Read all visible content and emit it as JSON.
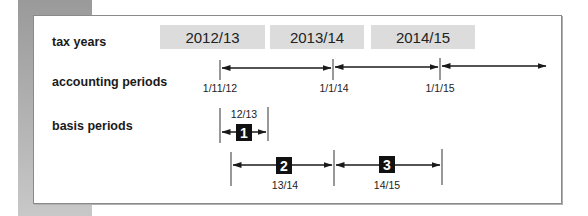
{
  "labels": {
    "tax_years": "tax years",
    "accounting_periods": "accounting periods",
    "basis_periods": "basis periods"
  },
  "tax_years": [
    {
      "label": "2012/13"
    },
    {
      "label": "2013/14"
    },
    {
      "label": "2014/15"
    }
  ],
  "accounting_dates": [
    {
      "label": "1/11/12"
    },
    {
      "label": "1/1/14"
    },
    {
      "label": "1/1/15"
    }
  ],
  "basis_periods": [
    {
      "number": "1",
      "label": "12/13"
    },
    {
      "number": "2",
      "label": "13/14"
    },
    {
      "number": "3",
      "label": "14/15"
    }
  ],
  "colors": {
    "tax_year_box": "#dcdcdc",
    "number_badge": "#111111",
    "line": "#1a1a1a",
    "frame_border": "#8a8a8a",
    "side_strip": "#a8a8a8"
  }
}
